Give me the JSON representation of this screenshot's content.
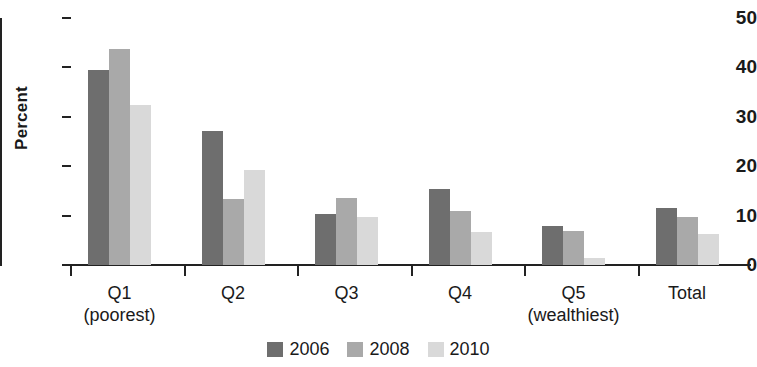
{
  "chart_data": {
    "type": "bar",
    "title": "",
    "subtitle": "",
    "xlabel": "",
    "ylabel": "Percent",
    "ylim": [
      0,
      50
    ],
    "yticks": [
      0,
      10,
      20,
      30,
      40,
      50
    ],
    "ytick_labels": [
      "0",
      "10",
      "20",
      "30",
      "40",
      "50"
    ],
    "grid": false,
    "legend_position": "bottom-center",
    "categories": [
      "Q1",
      "Q2",
      "Q3",
      "Q4",
      "Q5",
      "Total"
    ],
    "category_sublabels": [
      "(poorest)",
      "",
      "",
      "",
      "(wealthiest)",
      ""
    ],
    "series": [
      {
        "name": "2006",
        "color": "#6e6e6e",
        "values": [
          39.4,
          27.1,
          10.3,
          15.4,
          7.9,
          11.6
        ]
      },
      {
        "name": "2008",
        "color": "#a9a9a9",
        "values": [
          43.7,
          13.3,
          13.5,
          10.9,
          6.8,
          9.8
        ]
      },
      {
        "name": "2010",
        "color": "#d9d9d9",
        "values": [
          32.4,
          19.3,
          9.7,
          6.7,
          1.4,
          6.2
        ]
      }
    ]
  },
  "legend": {
    "items": [
      {
        "label": "2006",
        "color": "#6e6e6e"
      },
      {
        "label": "2008",
        "color": "#a9a9a9"
      },
      {
        "label": "2010",
        "color": "#d9d9d9"
      }
    ]
  },
  "colors": {
    "background": "#ffffff",
    "axis": "#222222",
    "text": "#1a1a1a",
    "series_2006": "#6e6e6e",
    "series_2008": "#a9a9a9",
    "series_2010": "#d9d9d9"
  }
}
